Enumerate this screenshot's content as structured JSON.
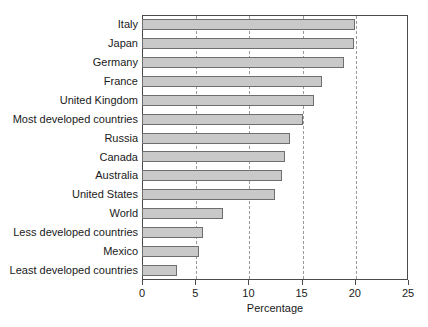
{
  "chart_data": {
    "type": "bar",
    "orientation": "horizontal",
    "title": "",
    "xlabel": "Percentage",
    "ylabel": "",
    "xlim": [
      0,
      25
    ],
    "ylim": null,
    "xticks": [
      0,
      5,
      10,
      15,
      20,
      25
    ],
    "xtick_labels": [
      "0",
      "5",
      "10",
      "15",
      "20",
      "25"
    ],
    "grid": "vertical-dashed",
    "legend": null,
    "bar_color": "#c9c9c9",
    "bar_edge_color": "#6e6e6e",
    "frame_color": "#4a4a4a",
    "grid_color": "#9a9a9a",
    "categories": [
      "Italy",
      "Japan",
      "Germany",
      "France",
      "United Kingdom",
      "Most developed countries",
      "Russia",
      "Canada",
      "Australia",
      "United States",
      "World",
      "Less developed countries",
      "Mexico",
      "Least developed countries"
    ],
    "values": [
      20.0,
      19.9,
      19.0,
      16.9,
      16.2,
      15.1,
      13.9,
      13.4,
      13.2,
      12.5,
      7.6,
      5.7,
      5.4,
      3.3
    ]
  }
}
